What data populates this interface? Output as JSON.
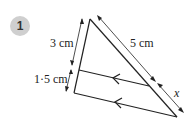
{
  "question": {
    "number": "1"
  },
  "labels": {
    "left_top": "3 cm",
    "left_bottom": "1·5 cm",
    "right_top": "5 cm",
    "right_bottom": "x"
  },
  "colors": {
    "stroke": "#222222",
    "badge": "#cfcfcf"
  }
}
